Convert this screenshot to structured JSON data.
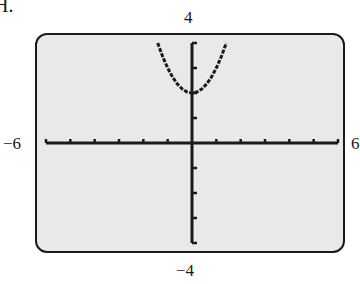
{
  "figure": {
    "label": "H.",
    "window_labels": {
      "ymax": "4",
      "ymin": "−4",
      "xmin": "−6",
      "xmax": "6"
    }
  },
  "colors": {
    "screen_bg": "#e9e9e9",
    "ink": "#1a1a1a"
  },
  "chart_data": {
    "type": "line",
    "title": "",
    "xlabel": "",
    "ylabel": "",
    "xlim": [
      -6,
      6
    ],
    "ylim": [
      -4,
      4
    ],
    "xscale": 1,
    "yscale": 1,
    "grid": false,
    "legend": null,
    "series": [
      {
        "name": "y = x^2 + 2",
        "x": [
          -1.41,
          -1.2,
          -1.0,
          -0.8,
          -0.6,
          -0.4,
          -0.2,
          0.0,
          0.2,
          0.4,
          0.6,
          0.8,
          1.0,
          1.2,
          1.41
        ],
        "y": [
          4.0,
          3.44,
          3.0,
          2.64,
          2.36,
          2.16,
          2.04,
          2.0,
          2.04,
          2.16,
          2.36,
          2.64,
          3.0,
          3.44,
          4.0
        ]
      }
    ],
    "tick_labels": {
      "x": [
        "-6",
        "6"
      ],
      "y": [
        "-4",
        "4"
      ]
    }
  }
}
